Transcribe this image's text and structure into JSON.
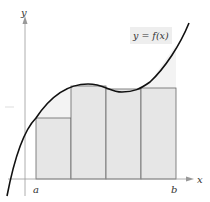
{
  "figure": {
    "function_label": "y = f(x)",
    "x_axis_label": "x",
    "y_axis_label": "y",
    "interval_start_label": "a",
    "interval_end_label": "b"
  },
  "rectangles": {
    "count": 4,
    "type": "lower sum / inscribed rectangles",
    "fill_color": "#e6e6e6",
    "stroke_color": "#555555"
  },
  "colors": {
    "curve": "#111111",
    "axis": "#999999",
    "background_tint": "#f2f2f2"
  }
}
